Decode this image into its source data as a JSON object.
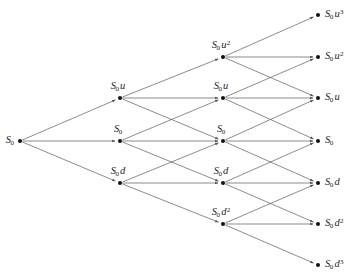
{
  "diagram": {
    "type": "trinomial-lattice",
    "steps": 3,
    "stroke_color": "#5a5a5a",
    "node_color": "#111111",
    "text_color": "#262626",
    "background": "#ffffff",
    "nodes": [
      {
        "id": "n0_0",
        "label": "S_0",
        "base": "S",
        "sub": "0",
        "factor": "",
        "exp": "",
        "x": 20,
        "y": 141,
        "step": 0,
        "level": 0,
        "label_pos": "left"
      },
      {
        "id": "n1_u",
        "label": "S_0 u",
        "base": "S",
        "sub": "0",
        "factor": "u",
        "exp": "",
        "x": 120,
        "y": 98,
        "step": 1,
        "level": 1,
        "label_pos": "above"
      },
      {
        "id": "n1_m",
        "label": "S_0",
        "base": "S",
        "sub": "0",
        "factor": "",
        "exp": "",
        "x": 120,
        "y": 141,
        "step": 1,
        "level": 0,
        "label_pos": "above"
      },
      {
        "id": "n1_d",
        "label": "S_0 d",
        "base": "S",
        "sub": "0",
        "factor": "d",
        "exp": "",
        "x": 120,
        "y": 183,
        "step": 1,
        "level": -1,
        "label_pos": "above"
      },
      {
        "id": "n2_uu",
        "label": "S_0 u^2",
        "base": "S",
        "sub": "0",
        "factor": "u",
        "exp": "2",
        "x": 223,
        "y": 57,
        "step": 2,
        "level": 2,
        "label_pos": "above"
      },
      {
        "id": "n2_u",
        "label": "S_0 u",
        "base": "S",
        "sub": "0",
        "factor": "u",
        "exp": "",
        "x": 223,
        "y": 98,
        "step": 2,
        "level": 1,
        "label_pos": "above"
      },
      {
        "id": "n2_m",
        "label": "S_0",
        "base": "S",
        "sub": "0",
        "factor": "",
        "exp": "",
        "x": 223,
        "y": 141,
        "step": 2,
        "level": 0,
        "label_pos": "above"
      },
      {
        "id": "n2_d",
        "label": "S_0 d",
        "base": "S",
        "sub": "0",
        "factor": "d",
        "exp": "",
        "x": 223,
        "y": 183,
        "step": 2,
        "level": -1,
        "label_pos": "above"
      },
      {
        "id": "n2_dd",
        "label": "S_0 d^2",
        "base": "S",
        "sub": "0",
        "factor": "d",
        "exp": "2",
        "x": 223,
        "y": 224,
        "step": 2,
        "level": -2,
        "label_pos": "above"
      },
      {
        "id": "n3_3u",
        "label": "S_0 u^3",
        "base": "S",
        "sub": "0",
        "factor": "u",
        "exp": "3",
        "x": 318,
        "y": 15,
        "step": 3,
        "level": 3,
        "label_pos": "right"
      },
      {
        "id": "n3_2u",
        "label": "S_0 u^2",
        "base": "S",
        "sub": "0",
        "factor": "u",
        "exp": "2",
        "x": 318,
        "y": 57,
        "step": 3,
        "level": 2,
        "label_pos": "right"
      },
      {
        "id": "n3_1u",
        "label": "S_0 u",
        "base": "S",
        "sub": "0",
        "factor": "u",
        "exp": "",
        "x": 318,
        "y": 98,
        "step": 3,
        "level": 1,
        "label_pos": "right"
      },
      {
        "id": "n3_0",
        "label": "S_0",
        "base": "S",
        "sub": "0",
        "factor": "",
        "exp": "",
        "x": 318,
        "y": 141,
        "step": 3,
        "level": 0,
        "label_pos": "right"
      },
      {
        "id": "n3_1d",
        "label": "S_0 d",
        "base": "S",
        "sub": "0",
        "factor": "d",
        "exp": "",
        "x": 318,
        "y": 183,
        "step": 3,
        "level": -1,
        "label_pos": "right"
      },
      {
        "id": "n3_2d",
        "label": "S_0 d^2",
        "base": "S",
        "sub": "0",
        "factor": "d",
        "exp": "2",
        "x": 318,
        "y": 224,
        "step": 3,
        "level": -2,
        "label_pos": "right"
      },
      {
        "id": "n3_3d",
        "label": "S_0 d^3",
        "base": "S",
        "sub": "0",
        "factor": "d",
        "exp": "3",
        "x": 318,
        "y": 265,
        "step": 3,
        "level": -3,
        "label_pos": "right"
      }
    ],
    "edges": [
      {
        "from": "n0_0",
        "to": "n1_u",
        "kind": "up"
      },
      {
        "from": "n0_0",
        "to": "n1_m",
        "kind": "flat"
      },
      {
        "from": "n0_0",
        "to": "n1_d",
        "kind": "down"
      },
      {
        "from": "n1_u",
        "to": "n2_uu",
        "kind": "up"
      },
      {
        "from": "n1_u",
        "to": "n2_u",
        "kind": "flat"
      },
      {
        "from": "n1_u",
        "to": "n2_m",
        "kind": "down"
      },
      {
        "from": "n1_m",
        "to": "n2_u",
        "kind": "up"
      },
      {
        "from": "n1_m",
        "to": "n2_m",
        "kind": "flat"
      },
      {
        "from": "n1_m",
        "to": "n2_d",
        "kind": "down"
      },
      {
        "from": "n1_d",
        "to": "n2_m",
        "kind": "up"
      },
      {
        "from": "n1_d",
        "to": "n2_d",
        "kind": "flat"
      },
      {
        "from": "n1_d",
        "to": "n2_dd",
        "kind": "down"
      },
      {
        "from": "n2_uu",
        "to": "n3_3u",
        "kind": "up"
      },
      {
        "from": "n2_uu",
        "to": "n3_2u",
        "kind": "flat"
      },
      {
        "from": "n2_uu",
        "to": "n3_1u",
        "kind": "down"
      },
      {
        "from": "n2_u",
        "to": "n3_2u",
        "kind": "up"
      },
      {
        "from": "n2_u",
        "to": "n3_1u",
        "kind": "flat"
      },
      {
        "from": "n2_u",
        "to": "n3_0",
        "kind": "down"
      },
      {
        "from": "n2_m",
        "to": "n3_1u",
        "kind": "up"
      },
      {
        "from": "n2_m",
        "to": "n3_0",
        "kind": "flat"
      },
      {
        "from": "n2_m",
        "to": "n3_1d",
        "kind": "down"
      },
      {
        "from": "n2_d",
        "to": "n3_0",
        "kind": "up"
      },
      {
        "from": "n2_d",
        "to": "n3_1d",
        "kind": "flat"
      },
      {
        "from": "n2_d",
        "to": "n3_2d",
        "kind": "down"
      },
      {
        "from": "n2_dd",
        "to": "n3_1d",
        "kind": "up"
      },
      {
        "from": "n2_dd",
        "to": "n3_2d",
        "kind": "flat"
      },
      {
        "from": "n2_dd",
        "to": "n3_3d",
        "kind": "down"
      }
    ]
  }
}
